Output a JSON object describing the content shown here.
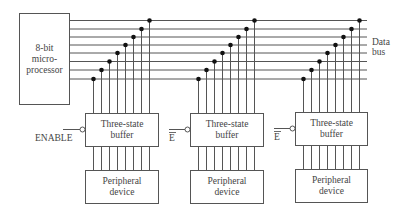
{
  "diagram": {
    "microprocessor": {
      "lines": [
        "8-bit",
        "micro-",
        "processor"
      ]
    },
    "data_bus_label": [
      "Data",
      "bus"
    ],
    "bus_line_count": 8,
    "units": [
      {
        "enable_label": "ENABLE",
        "enable_overbar": false,
        "buffer_lines": [
          "Three-state",
          "buffer"
        ],
        "peripheral_lines": [
          "Peripheral",
          "device"
        ]
      },
      {
        "enable_label": "E",
        "enable_overbar": true,
        "buffer_lines": [
          "Three-state",
          "buffer"
        ],
        "peripheral_lines": [
          "Peripheral",
          "device"
        ]
      },
      {
        "enable_label": "E",
        "enable_overbar": true,
        "buffer_lines": [
          "Three-state",
          "buffer"
        ],
        "peripheral_lines": [
          "Peripheral",
          "device"
        ]
      }
    ]
  }
}
